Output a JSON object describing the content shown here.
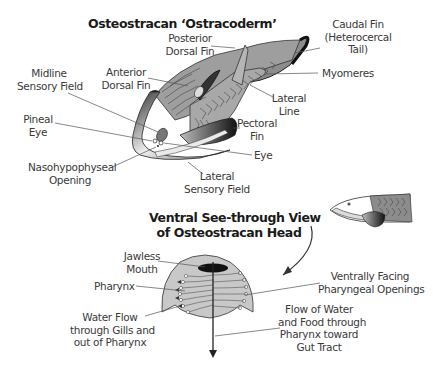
{
  "titles": {
    "main": "Osteostracan ‘Ostracoderm’",
    "ventral_line1": "Ventral See-through View",
    "ventral_line2": "of Osteostracan Head"
  },
  "labels": {
    "caudal_fin": [
      "Caudal Fin",
      "(Heterocercal",
      "Tail)"
    ],
    "posterior_dorsal_fin": [
      "Posterior",
      "Dorsal Fin"
    ],
    "anterior_dorsal_fin": [
      "Anterior",
      "Dorsal Fin"
    ],
    "midline_sensory_field": [
      "Midline",
      "Sensory Field"
    ],
    "myomeres": [
      "Myomeres"
    ],
    "lateral_line": [
      "Lateral",
      "Line"
    ],
    "pineal_eye": [
      "Pineal",
      "Eye"
    ],
    "pectoral_fin": [
      "Pectoral",
      "Fin"
    ],
    "eye": [
      "Eye"
    ],
    "nasohypophyseal_opening": [
      "Nasohypophyseal",
      "Opening"
    ],
    "lateral_sensory_field": [
      "Lateral",
      "Sensory Field"
    ],
    "jawless_mouth": [
      "Jawless",
      "Mouth"
    ],
    "pharynx": [
      "Pharynx"
    ],
    "ventrally_facing_pharyngeal_openings": [
      "Ventrally Facing",
      "Pharyngeal Openings"
    ],
    "water_flow_gills": [
      "Water Flow",
      "through Gills and",
      "out of Pharynx"
    ],
    "flow_water_food": [
      "Flow of Water",
      "and Food through",
      "Pharynx toward",
      "Gut Tract"
    ]
  },
  "colors": {
    "body_gray": "#9a9a9a",
    "dark_gray": "#3c3c3c",
    "head_fill": "#c8c8c8",
    "line": "#555555",
    "text": "#3a3a3a"
  }
}
